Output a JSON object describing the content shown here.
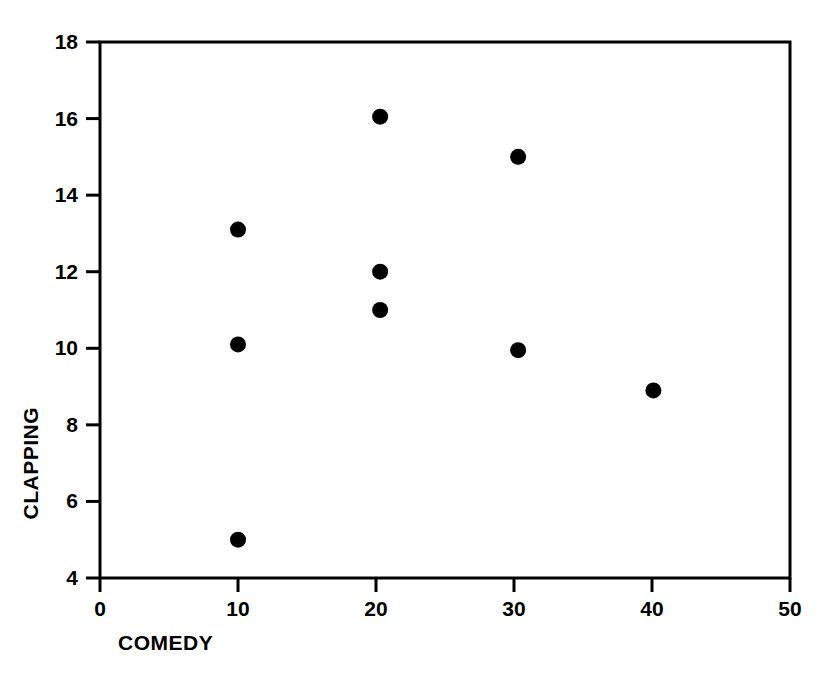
{
  "chart_data": {
    "type": "scatter",
    "title": "",
    "xlabel": "COMEDY",
    "ylabel": "CLAPPING",
    "xlim": [
      0,
      50
    ],
    "ylim": [
      4,
      18
    ],
    "xticks": [
      0,
      10,
      20,
      30,
      40,
      50
    ],
    "yticks": [
      4,
      6,
      8,
      10,
      12,
      14,
      16,
      18
    ],
    "xtick_labels": [
      "0",
      "10",
      "20",
      "30",
      "40",
      "50"
    ],
    "ytick_labels": [
      "4",
      "6",
      "8",
      "10",
      "12",
      "14",
      "16",
      "18"
    ],
    "grid": false,
    "legend": null,
    "frame": "full-box",
    "marker": {
      "shape": "circle",
      "color": "#000000",
      "size_px": 16
    },
    "series": [
      {
        "name": "observations",
        "color": "#000000",
        "points": [
          {
            "x": 10.0,
            "y": 13.1
          },
          {
            "x": 10.0,
            "y": 10.1
          },
          {
            "x": 10.0,
            "y": 5.0
          },
          {
            "x": 20.3,
            "y": 16.05
          },
          {
            "x": 20.3,
            "y": 12.0
          },
          {
            "x": 20.3,
            "y": 11.0
          },
          {
            "x": 30.3,
            "y": 15.0
          },
          {
            "x": 30.3,
            "y": 9.95
          },
          {
            "x": 40.1,
            "y": 8.9
          }
        ]
      }
    ]
  }
}
